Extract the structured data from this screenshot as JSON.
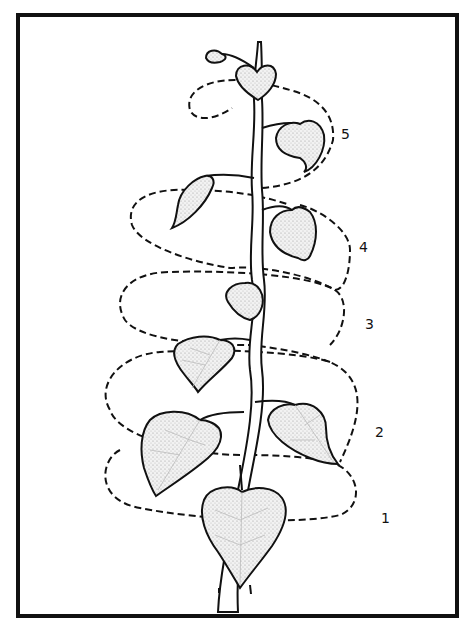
{
  "figure": {
    "border_color": "#111111",
    "line_color": "#111111",
    "leaf_fill": "#e6e6e6",
    "path_style": "dashed",
    "stage_labels": [
      {
        "id": "1",
        "text": "1"
      },
      {
        "id": "2",
        "text": "2"
      },
      {
        "id": "3",
        "text": "3"
      },
      {
        "id": "4",
        "text": "4"
      },
      {
        "id": "5",
        "text": "5"
      }
    ]
  }
}
